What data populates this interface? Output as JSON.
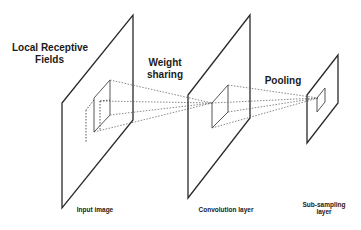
{
  "diagram": {
    "type": "cnn-architecture",
    "labels": {
      "local_receptive_fields": "Local Receptive\nFields",
      "local_receptive_fields_line1": "Local Receptive",
      "local_receptive_fields_line2": "Fields",
      "weight_sharing_line1": "Weight",
      "weight_sharing_line2": "sharing",
      "pooling": "Pooling",
      "input_image": "Input image",
      "convolution_layer": "Convolution layer",
      "subsampling_line1": "Sub-sampling",
      "subsampling_line2": "layer"
    },
    "layers": [
      {
        "name": "Input image",
        "plane": [
          [
            62,
            103
          ],
          [
            133,
            15
          ],
          [
            133,
            120
          ],
          [
            62,
            208
          ]
        ]
      },
      {
        "name": "Convolution layer",
        "plane": [
          [
            188,
            95
          ],
          [
            250,
            15
          ],
          [
            250,
            118
          ],
          [
            188,
            198
          ]
        ]
      },
      {
        "name": "Sub-sampling layer",
        "plane": [
          [
            307,
            95
          ],
          [
            338,
            55
          ],
          [
            338,
            103
          ],
          [
            307,
            143
          ]
        ]
      }
    ],
    "colors": {
      "line": "#2a2a2a",
      "dotted": "#555555",
      "background": "#ffffff"
    }
  }
}
